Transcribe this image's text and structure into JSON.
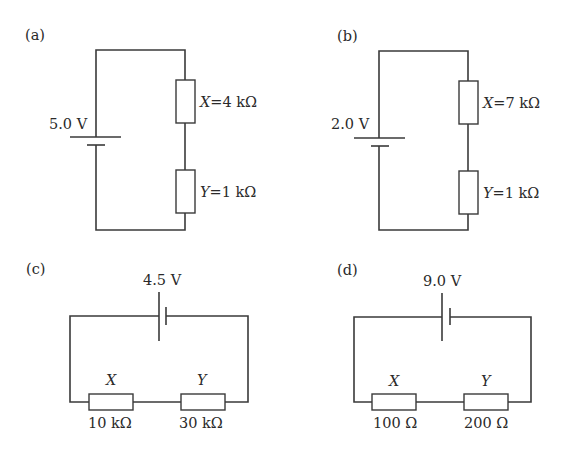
{
  "circuits": {
    "a": {
      "label": "(a)",
      "voltage": "5.0 V",
      "x_label": "X",
      "x_value": "=4 kΩ",
      "y_label": "Y",
      "y_value": "=1 kΩ"
    },
    "b": {
      "label": "(b)",
      "voltage": "2.0 V",
      "x_label": "X",
      "x_value": "=7 kΩ",
      "y_label": "Y",
      "y_value": "=1 kΩ"
    },
    "c": {
      "label": "(c)",
      "voltage": "4.5 V",
      "x_label": "X",
      "x_value": "10 kΩ",
      "y_label": "Y",
      "y_value": "30 kΩ"
    },
    "d": {
      "label": "(d)",
      "voltage": "9.0 V",
      "x_label": "X",
      "x_value": "100 Ω",
      "y_label": "Y",
      "y_value": "200 Ω"
    }
  }
}
